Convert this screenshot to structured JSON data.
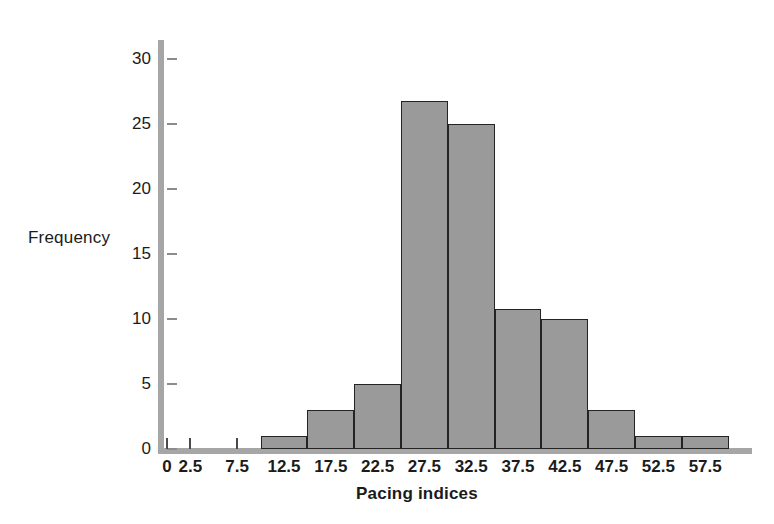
{
  "chart_data": {
    "type": "bar",
    "title": "",
    "xlabel": "Pacing indices",
    "ylabel": "Frequency",
    "grid": false,
    "legend": null,
    "xlim": [
      0,
      62.5
    ],
    "ylim": [
      0,
      31.5
    ],
    "bin_width": 5,
    "bin_edges": [
      0,
      5,
      10,
      15,
      20,
      25,
      30,
      35,
      40,
      45,
      50,
      55,
      60
    ],
    "categories": [
      "0-5",
      "5-10",
      "10-15",
      "15-20",
      "20-25",
      "25-30",
      "30-35",
      "35-40",
      "40-45",
      "45-50",
      "50-55",
      "55-60"
    ],
    "values": [
      0,
      0,
      1,
      3,
      5,
      26.8,
      25,
      10.8,
      10,
      3,
      1,
      1
    ],
    "xticklabels": [
      "0",
      "2.5",
      "7.5",
      "12.5",
      "17.5",
      "22.5",
      "27.5",
      "32.5",
      "37.5",
      "42.5",
      "47.5",
      "52.5",
      "57.5"
    ],
    "xtickvalues": [
      0,
      2.5,
      7.5,
      12.5,
      17.5,
      22.5,
      27.5,
      32.5,
      37.5,
      42.5,
      47.5,
      52.5,
      57.5
    ],
    "yticklabels": [
      "0",
      "5",
      "10",
      "15",
      "20",
      "25",
      "30"
    ],
    "ytickvalues": [
      0,
      5,
      10,
      15,
      20,
      25,
      30
    ],
    "bar_fill_color": "#9a9a9a",
    "bar_edge_color": "#232323",
    "axis_color": "#a6a6a6",
    "text_color": "#1b1b1b"
  },
  "axes": {
    "ylabel_text": "Frequency",
    "xlabel_text": "Pacing indices"
  }
}
